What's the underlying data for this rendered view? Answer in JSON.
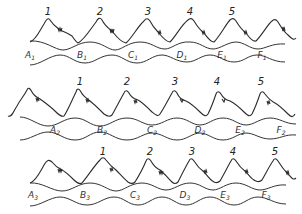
{
  "diagram": {
    "rows": [
      {
        "id": "row-1",
        "peak_labels": [
          {
            "text": "1",
            "x": 48
          },
          {
            "text": "2",
            "x": 100
          },
          {
            "text": "3",
            "x": 148
          },
          {
            "text": "4",
            "x": 190
          },
          {
            "text": "5",
            "x": 232
          }
        ],
        "cell_labels": [
          {
            "text": "A",
            "sub": "1",
            "x": 30
          },
          {
            "text": "B",
            "sub": "1",
            "x": 82
          },
          {
            "text": "C",
            "sub": "1",
            "x": 133
          },
          {
            "text": "D",
            "sub": "1",
            "x": 182
          },
          {
            "text": "E",
            "sub": "1",
            "x": 222
          },
          {
            "text": "F",
            "sub": "1",
            "x": 262
          }
        ]
      },
      {
        "id": "row-2",
        "peak_labels": [
          {
            "text": "1",
            "x": 80
          },
          {
            "text": "2",
            "x": 127
          },
          {
            "text": "3",
            "x": 175
          },
          {
            "text": "4",
            "x": 217
          },
          {
            "text": "5",
            "x": 261
          }
        ],
        "cell_labels": [
          {
            "text": "A",
            "sub": "2",
            "x": 55
          },
          {
            "text": "B",
            "sub": "2",
            "x": 102
          },
          {
            "text": "C",
            "sub": "2",
            "x": 152
          },
          {
            "text": "D",
            "sub": "2",
            "x": 200
          },
          {
            "text": "E",
            "sub": "2",
            "x": 240
          },
          {
            "text": "F",
            "sub": "2",
            "x": 281
          }
        ]
      },
      {
        "id": "row-3",
        "peak_labels": [
          {
            "text": "1",
            "x": 103
          },
          {
            "text": "2",
            "x": 150
          },
          {
            "text": "3",
            "x": 192
          },
          {
            "text": "4",
            "x": 233
          },
          {
            "text": "5",
            "x": 275
          }
        ],
        "cell_labels": [
          {
            "text": "A",
            "sub": "3",
            "x": 33
          },
          {
            "text": "B",
            "sub": "3",
            "x": 85
          },
          {
            "text": "C",
            "sub": "3",
            "x": 135
          },
          {
            "text": "D",
            "sub": "3",
            "x": 185
          },
          {
            "text": "E",
            "sub": "3",
            "x": 225
          },
          {
            "text": "F",
            "sub": "3",
            "x": 266
          }
        ]
      }
    ]
  }
}
